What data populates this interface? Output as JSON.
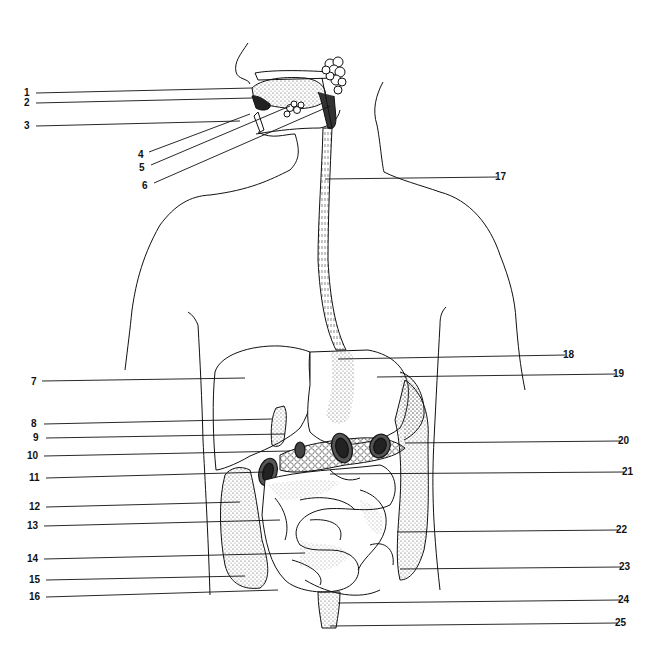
{
  "diagram": {
    "line_color": "#111111",
    "stipple_color": "#555555",
    "background": "#ffffff",
    "labels": [
      {
        "id": "1",
        "text": "1",
        "side": "left",
        "tx": 28,
        "ty": 93,
        "x1": 36,
        "y1": 93,
        "x2": 252,
        "y2": 88
      },
      {
        "id": "2",
        "text": "2",
        "side": "left",
        "tx": 28,
        "ty": 103,
        "x1": 36,
        "y1": 103,
        "x2": 252,
        "y2": 98
      },
      {
        "id": "3",
        "text": "3",
        "side": "left",
        "tx": 28,
        "ty": 126,
        "x1": 36,
        "y1": 126,
        "x2": 240,
        "y2": 121
      },
      {
        "id": "4",
        "text": "4",
        "side": "left",
        "tx": 142,
        "ty": 155,
        "x1": 149,
        "y1": 152,
        "x2": 250,
        "y2": 114
      },
      {
        "id": "5",
        "text": "5",
        "side": "left",
        "tx": 143,
        "ty": 168,
        "x1": 151,
        "y1": 165,
        "x2": 290,
        "y2": 106
      },
      {
        "id": "6",
        "text": "6",
        "side": "left",
        "tx": 146,
        "ty": 186,
        "x1": 154,
        "y1": 183,
        "x2": 330,
        "y2": 106
      },
      {
        "id": "7",
        "text": "7",
        "side": "left",
        "tx": 35,
        "ty": 382,
        "x1": 42,
        "y1": 381,
        "x2": 245,
        "y2": 378
      },
      {
        "id": "8",
        "text": "8",
        "side": "left",
        "tx": 35,
        "ty": 424,
        "x1": 44,
        "y1": 424,
        "x2": 272,
        "y2": 419
      },
      {
        "id": "9",
        "text": "9",
        "side": "left",
        "tx": 37,
        "ty": 438,
        "x1": 46,
        "y1": 438,
        "x2": 285,
        "y2": 434
      },
      {
        "id": "10",
        "text": "10",
        "side": "left",
        "tx": 31,
        "ty": 456,
        "x1": 44,
        "y1": 456,
        "x2": 290,
        "y2": 451
      },
      {
        "id": "11",
        "text": "11",
        "side": "left",
        "tx": 33,
        "ty": 478,
        "x1": 46,
        "y1": 478,
        "x2": 265,
        "y2": 472
      },
      {
        "id": "12",
        "text": "12",
        "side": "left",
        "tx": 33,
        "ty": 507,
        "x1": 46,
        "y1": 507,
        "x2": 240,
        "y2": 502
      },
      {
        "id": "13",
        "text": "13",
        "side": "left",
        "tx": 31,
        "ty": 526,
        "x1": 44,
        "y1": 526,
        "x2": 280,
        "y2": 520
      },
      {
        "id": "14",
        "text": "14",
        "side": "left",
        "tx": 31,
        "ty": 559,
        "x1": 44,
        "y1": 559,
        "x2": 305,
        "y2": 553
      },
      {
        "id": "15",
        "text": "15",
        "side": "left",
        "tx": 33,
        "ty": 580,
        "x1": 46,
        "y1": 580,
        "x2": 245,
        "y2": 576
      },
      {
        "id": "16",
        "text": "16",
        "side": "left",
        "tx": 33,
        "ty": 597,
        "x1": 46,
        "y1": 597,
        "x2": 278,
        "y2": 590
      },
      {
        "id": "17",
        "text": "17",
        "side": "right",
        "tx": 499,
        "ty": 177,
        "x1": 325,
        "y1": 179,
        "x2": 497,
        "y2": 177
      },
      {
        "id": "18",
        "text": "18",
        "side": "right",
        "tx": 567,
        "ty": 355,
        "x1": 338,
        "y1": 359,
        "x2": 565,
        "y2": 355
      },
      {
        "id": "19",
        "text": "19",
        "side": "right",
        "tx": 617,
        "ty": 374,
        "x1": 377,
        "y1": 377,
        "x2": 615,
        "y2": 374
      },
      {
        "id": "20",
        "text": "20",
        "side": "right",
        "tx": 622,
        "ty": 441,
        "x1": 405,
        "y1": 443,
        "x2": 620,
        "y2": 441
      },
      {
        "id": "21",
        "text": "21",
        "side": "right",
        "tx": 626,
        "ty": 472,
        "x1": 330,
        "y1": 474,
        "x2": 624,
        "y2": 472
      },
      {
        "id": "22",
        "text": "22",
        "side": "right",
        "tx": 620,
        "ty": 530,
        "x1": 397,
        "y1": 532,
        "x2": 618,
        "y2": 530
      },
      {
        "id": "23",
        "text": "23",
        "side": "right",
        "tx": 623,
        "ty": 567,
        "x1": 400,
        "y1": 569,
        "x2": 621,
        "y2": 567
      },
      {
        "id": "24",
        "text": "24",
        "side": "right",
        "tx": 622,
        "ty": 600,
        "x1": 338,
        "y1": 603,
        "x2": 620,
        "y2": 600
      },
      {
        "id": "25",
        "text": "25",
        "side": "right",
        "tx": 619,
        "ty": 623,
        "x1": 330,
        "y1": 626,
        "x2": 617,
        "y2": 623
      }
    ]
  }
}
